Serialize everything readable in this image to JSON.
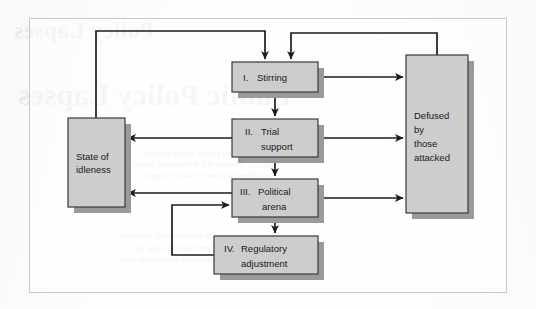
{
  "figure": {
    "frame_border_color": "#c8c8c8",
    "box_fill": "#cdcdcd",
    "box_stroke": "#3a3a3a",
    "box_shadow": "#9a9a9a",
    "arrow_color": "#1c1c1c",
    "page_background": "#fdfdfd"
  },
  "bleed_through": {
    "heading": "Policy Lapses",
    "title": "Public Policy Lapses",
    "body": "lorem sit amet policy lapses and the\nstate of idleness sed do eiusmod tempor\nincididunt ut labore et dolore magna",
    "body2": "ut enim ad minim veniam quis nostrud\nexercitation ullamco laboris nisi ut\naliquip ex ea commodo consequat duis"
  },
  "nodes": [
    {
      "id": "stirring",
      "label": "I.  Stirring",
      "text_align": "left",
      "x": 232,
      "y": 62,
      "w": 86,
      "h": 30
    },
    {
      "id": "trial",
      "label": "II.  Trial\nsupport",
      "text_align": "center",
      "x": 232,
      "y": 119,
      "w": 86,
      "h": 38
    },
    {
      "id": "political",
      "label": "III.  Political\narena",
      "text_align": "center",
      "x": 232,
      "y": 179,
      "w": 86,
      "h": 38
    },
    {
      "id": "regulatory",
      "label": "IV.  Regulatory\nadjustment",
      "text_align": "center",
      "x": 214,
      "y": 236,
      "w": 104,
      "h": 38
    },
    {
      "id": "idleness",
      "label": "State of\nidleness",
      "text_align": "left",
      "x": 68,
      "y": 118,
      "w": 57,
      "h": 89
    },
    {
      "id": "defused",
      "label": "Defused\nby\nthose\nattacked",
      "text_align": "left",
      "x": 406,
      "y": 55,
      "w": 62,
      "h": 158
    }
  ],
  "node_labels": {
    "stirring_num": "I.",
    "stirring_text": "Stirring",
    "trial_num": "II.",
    "trial_text_1": "Trial",
    "trial_text_2": "support",
    "political_num": "III.",
    "political_text_1": "Political",
    "political_text_2": "arena",
    "regulatory_num": "IV.",
    "regulatory_text_1": "Regulatory",
    "regulatory_text_2": "adjustment",
    "idleness_text_1": "State of",
    "idleness_text_2": "idleness",
    "defused_text_1": "Defused",
    "defused_text_2": "by",
    "defused_text_3": "those",
    "defused_text_4": "attacked"
  },
  "edges": [
    {
      "id": "idleness-to-stirring",
      "from": "idleness",
      "to": "stirring",
      "style": "orthogonal-up-right",
      "arrowhead": "at-target-top"
    },
    {
      "id": "defused-to-stirring",
      "from": "defused",
      "to": "stirring",
      "style": "orthogonal-up-left",
      "arrowhead": "at-target-top"
    },
    {
      "id": "stirring-to-trial",
      "from": "stirring",
      "to": "trial",
      "style": "vertical",
      "arrowhead": "at-target-top"
    },
    {
      "id": "trial-to-political",
      "from": "trial",
      "to": "political",
      "style": "vertical",
      "arrowhead": "at-target-top"
    },
    {
      "id": "political-to-regulatory",
      "from": "political",
      "to": "regulatory",
      "style": "vertical",
      "arrowhead": "at-target-top"
    },
    {
      "id": "stirring-to-defused",
      "from": "stirring",
      "to": "defused",
      "style": "horizontal-right",
      "arrowhead": "at-target-left"
    },
    {
      "id": "trial-to-defused",
      "from": "trial",
      "to": "defused",
      "style": "horizontal-right",
      "arrowhead": "at-target-left"
    },
    {
      "id": "political-to-defused",
      "from": "political",
      "to": "defused",
      "style": "horizontal-right",
      "arrowhead": "at-target-left"
    },
    {
      "id": "trial-to-idleness",
      "from": "trial",
      "to": "idleness",
      "style": "horizontal-left",
      "arrowhead": "at-target-right"
    },
    {
      "id": "political-to-idleness",
      "from": "political",
      "to": "idleness",
      "style": "horizontal-left",
      "arrowhead": "at-target-right"
    },
    {
      "id": "regulatory-to-political",
      "from": "regulatory",
      "to": "political",
      "style": "feedback-loop-left",
      "arrowhead": "at-target-left"
    }
  ]
}
